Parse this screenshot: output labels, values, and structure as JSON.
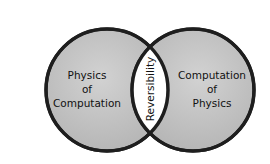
{
  "diagram": {
    "type": "venn",
    "circles": [
      {
        "id": "left",
        "lines": [
          "Physics",
          "of",
          "Computation"
        ]
      },
      {
        "id": "right",
        "lines": [
          "Computation",
          "of",
          "Physics"
        ]
      }
    ],
    "intersection": {
      "label": "Reversibility"
    },
    "colors": {
      "circle_fill": "#c6c6c6",
      "circle_stroke": "#1e1e1e",
      "intersection_fill": "#ffffff",
      "text": "#111111"
    }
  }
}
